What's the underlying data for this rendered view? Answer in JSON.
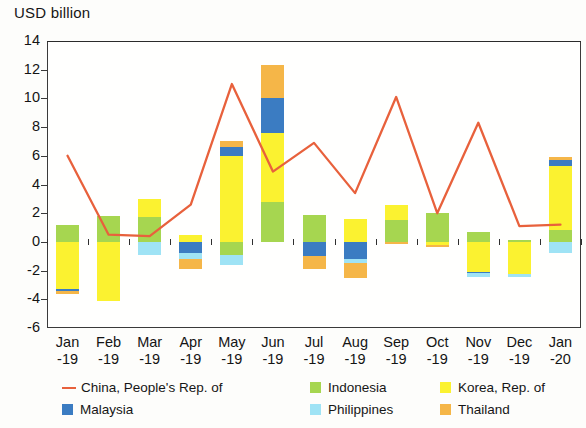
{
  "chart_data": {
    "type": "bar",
    "title": "",
    "subtitle": "",
    "ylabel": "USD billion",
    "xlabel": "",
    "ylim": [
      -6,
      14
    ],
    "ytick_step": 2,
    "grid": false,
    "stacked": true,
    "legend_position": "bottom",
    "categories": [
      "Jan\n-19",
      "Feb\n-19",
      "Mar\n-19",
      "Apr\n-19",
      "May\n-19",
      "Jun\n-19",
      "Jul\n-19",
      "Aug\n-19",
      "Sep\n-19",
      "Oct\n-19",
      "Nov\n-19",
      "Dec\n-19",
      "Jan\n-20"
    ],
    "category_labels": [
      {
        "top": "Jan",
        "bottom": "-19"
      },
      {
        "top": "Feb",
        "bottom": "-19"
      },
      {
        "top": "Mar",
        "bottom": "-19"
      },
      {
        "top": "Apr",
        "bottom": "-19"
      },
      {
        "top": "May",
        "bottom": "-19"
      },
      {
        "top": "Jun",
        "bottom": "-19"
      },
      {
        "top": "Jul",
        "bottom": "-19"
      },
      {
        "top": "Aug",
        "bottom": "-19"
      },
      {
        "top": "Sep",
        "bottom": "-19"
      },
      {
        "top": "Oct",
        "bottom": "-19"
      },
      {
        "top": "Nov",
        "bottom": "-19"
      },
      {
        "top": "Dec",
        "bottom": "-19"
      },
      {
        "top": "Jan",
        "bottom": "-20"
      }
    ],
    "ytick_labels": [
      "14",
      "12",
      "10",
      "8",
      "6",
      "4",
      "2",
      "0",
      "-2",
      "-4",
      "-6"
    ],
    "ytick_values": [
      14,
      12,
      10,
      8,
      6,
      4,
      2,
      0,
      -2,
      -4,
      -6
    ],
    "series": [
      {
        "name": "Indonesia",
        "kind": "bar",
        "color": "#a6d650",
        "values": [
          1.2,
          1.8,
          1.75,
          0.0,
          -0.9,
          2.8,
          1.9,
          0.0,
          1.5,
          2.0,
          0.7,
          0.15,
          0.8
        ]
      },
      {
        "name": "Korea, Rep. of",
        "kind": "bar",
        "color": "#fbf230",
        "values": [
          -3.25,
          -4.1,
          1.25,
          0.5,
          6.0,
          4.8,
          0.0,
          1.6,
          1.1,
          -0.25,
          -2.1,
          -2.25,
          4.5
        ]
      },
      {
        "name": "Malaysia",
        "kind": "bar",
        "color": "#3b7cc2",
        "values": [
          -0.2,
          0.0,
          0.0,
          -0.8,
          0.6,
          2.4,
          -1.0,
          -1.2,
          0.0,
          0.0,
          -0.1,
          0.0,
          0.4
        ]
      },
      {
        "name": "Philippines",
        "kind": "bar",
        "color": "#9fe3f5",
        "values": [
          0.0,
          0.0,
          -0.9,
          -0.4,
          -0.7,
          0.0,
          0.0,
          -0.3,
          0.0,
          0.0,
          -0.25,
          -0.2,
          -0.8
        ]
      },
      {
        "name": "Thailand",
        "kind": "bar",
        "color": "#f5b648",
        "values": [
          -0.15,
          0.0,
          0.0,
          -0.7,
          0.4,
          2.3,
          -0.9,
          -1.0,
          -0.15,
          -0.1,
          0.0,
          0.0,
          0.2
        ]
      },
      {
        "name": "China, People's Rep. of",
        "kind": "line",
        "color": "#e8613c",
        "values": [
          6.0,
          0.5,
          0.4,
          2.6,
          11.0,
          4.9,
          6.9,
          3.4,
          10.1,
          2.0,
          8.3,
          1.1,
          1.2
        ]
      }
    ]
  },
  "legend": {
    "entries": [
      {
        "label": "China, People's Rep. of",
        "color": "#e8613c",
        "marker": "line"
      },
      {
        "label": "Indonesia",
        "color": "#a6d650",
        "marker": "square"
      },
      {
        "label": "Korea, Rep. of",
        "color": "#fbf230",
        "marker": "square"
      },
      {
        "label": "Malaysia",
        "color": "#3b7cc2",
        "marker": "square"
      },
      {
        "label": "Philippines",
        "color": "#9fe3f5",
        "marker": "square"
      },
      {
        "label": "Thailand",
        "color": "#f5b648",
        "marker": "square"
      }
    ]
  },
  "axis": {
    "y_title": "USD billion"
  },
  "colors": {
    "line": "#e8613c",
    "indonesia": "#a6d650",
    "korea": "#fbf230",
    "malaysia": "#3b7cc2",
    "philippines": "#9fe3f5",
    "thailand": "#f5b648",
    "frame": "#3a3a3a",
    "text": "#141414"
  }
}
